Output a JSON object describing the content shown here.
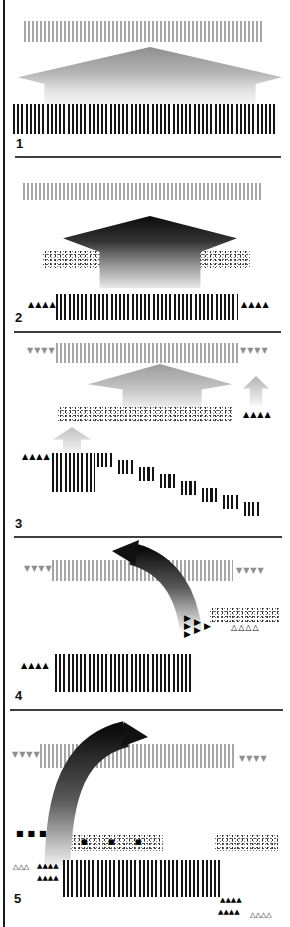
{
  "figure": {
    "description_numbers": [
      "1",
      "2",
      "3",
      "4",
      "5"
    ]
  },
  "colors": {
    "stripe_dark": "#141414",
    "stripe_light": "#a6a6a6",
    "marker_black": "#000000",
    "marker_gray": "#8f8f8f",
    "arrow_dark_top": "#0d0d0d",
    "arrow_fade_bottom": "#ffffff",
    "divider": "#3f3f3f"
  },
  "panels": [
    {
      "label": "1"
    },
    {
      "label": "2",
      "left_markers": "▲▲▲▲",
      "right_markers": "▲▲▲▲"
    },
    {
      "label": "3",
      "top_left_markers": "▼▼▼▼",
      "top_right_markers": "▼▼▼▼",
      "mid_right_markers": "▲▲▲▲",
      "left_markers": "▲▲▲▲"
    },
    {
      "label": "4",
      "top_left_markers": "▼▼▼▼",
      "top_right_markers": "▼▼▼▼",
      "cluster_cols": [
        "▶▶▶",
        "▶▶",
        "▶"
      ],
      "open_markers": "△△△△",
      "left_markers": "▲▲▲▲"
    },
    {
      "label": "5",
      "top_left_markers": "▼▼▼▼",
      "top_right_markers": "▼▼▼▼",
      "squares": "■■■",
      "band_squares": [
        "■",
        "■",
        "■"
      ],
      "open_left_markers": "△△△",
      "black_left_row1": "▲▲▲▲",
      "black_left_row2": "▲▲▲▲",
      "black_right_row1": "▲▲▲▲",
      "black_right_row2": "▲▲▲▲",
      "open_right_markers": "△△△△"
    }
  ]
}
